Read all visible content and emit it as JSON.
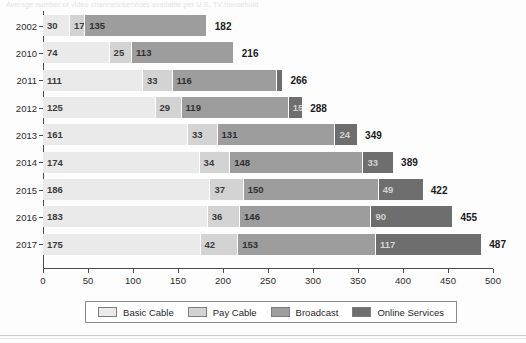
{
  "ghost_title_text": "Average number of video channels/services available per U.S. TV household",
  "colors": {
    "basic_cable": "#eaeaea",
    "pay_cable": "#d3d3d3",
    "broadcast": "#9d9d9d",
    "online_services": "#6e6e6e",
    "axis": "#4a4a4a",
    "total_label": "#1b1b1b"
  },
  "legend": {
    "items": [
      {
        "label": "Basic Cable",
        "swatch": "basic_cable",
        "icon": "legend-swatch-icon"
      },
      {
        "label": "Pay Cable",
        "swatch": "pay_cable",
        "icon": "legend-swatch-icon"
      },
      {
        "label": "Broadcast",
        "swatch": "broadcast",
        "icon": "legend-swatch-icon"
      },
      {
        "label": "Online Services",
        "swatch": "online_services",
        "icon": "legend-swatch-icon"
      }
    ]
  },
  "chart_data": {
    "type": "bar",
    "orientation": "horizontal",
    "stacked": true,
    "title": "",
    "xlabel": "",
    "ylabel": "",
    "xlim": [
      0,
      500
    ],
    "xticks": [
      0,
      50,
      100,
      150,
      200,
      250,
      300,
      350,
      400,
      450,
      500
    ],
    "xtick_labels": [
      "0",
      "50",
      "100",
      "150",
      "200",
      "250",
      "300",
      "350",
      "400",
      "450",
      "500"
    ],
    "grid": false,
    "legend_position": "bottom",
    "categories": [
      "2002",
      "2010",
      "2011",
      "2012",
      "2013",
      "2014",
      "2015",
      "2016",
      "2017"
    ],
    "series": [
      {
        "name": "Basic Cable",
        "values": [
          30,
          74,
          111,
          125,
          161,
          174,
          186,
          183,
          175
        ]
      },
      {
        "name": "Pay Cable",
        "values": [
          17,
          25,
          33,
          29,
          33,
          34,
          37,
          36,
          42
        ]
      },
      {
        "name": "Broadcast",
        "values": [
          135,
          113,
          116,
          119,
          131,
          148,
          150,
          146,
          153
        ]
      },
      {
        "name": "Online Services",
        "values": [
          0,
          0,
          6,
          15,
          24,
          33,
          49,
          90,
          117
        ]
      }
    ],
    "segment_labels": [
      [
        "30",
        "17",
        "135",
        ""
      ],
      [
        "74",
        "25",
        "113",
        ""
      ],
      [
        "111",
        "33",
        "116",
        ""
      ],
      [
        "125",
        "29",
        "119",
        "15"
      ],
      [
        "161",
        "33",
        "131",
        "24"
      ],
      [
        "174",
        "34",
        "148",
        "33"
      ],
      [
        "186",
        "37",
        "150",
        "49"
      ],
      [
        "183",
        "36",
        "146",
        "90"
      ],
      [
        "175",
        "42",
        "153",
        "117"
      ]
    ],
    "totals": [
      182,
      216,
      266,
      288,
      349,
      389,
      422,
      455,
      487
    ],
    "total_labels": [
      "182",
      "216",
      "266",
      "288",
      "349",
      "389",
      "422",
      "455",
      "487"
    ]
  }
}
